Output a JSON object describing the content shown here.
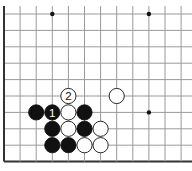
{
  "board": {
    "title": "Go board diagram",
    "origin_x": 4,
    "origin_y": 14,
    "spacing_x": 16.1,
    "spacing_y": 16.4,
    "cols": 12,
    "rows": 10,
    "line_color": "#9a9a9a",
    "edge_color": "#333333",
    "left_edge": true,
    "bottom_edge": true,
    "right_extend_to": 192,
    "top_extend_from": 6
  },
  "star_points": [
    {
      "col": 3,
      "row": 0
    },
    {
      "col": 9,
      "row": 0
    },
    {
      "col": 9,
      "row": 6
    }
  ],
  "stones": [
    {
      "col": 4,
      "row": 5,
      "color": "white",
      "label": "2"
    },
    {
      "col": 7,
      "row": 5,
      "color": "white",
      "label": ""
    },
    {
      "col": 2,
      "row": 6,
      "color": "black",
      "label": ""
    },
    {
      "col": 3,
      "row": 6,
      "color": "black",
      "label": "1"
    },
    {
      "col": 4,
      "row": 6,
      "color": "white",
      "label": ""
    },
    {
      "col": 5,
      "row": 6,
      "color": "black",
      "label": ""
    },
    {
      "col": 3,
      "row": 7,
      "color": "black",
      "label": ""
    },
    {
      "col": 4,
      "row": 7,
      "color": "white",
      "label": ""
    },
    {
      "col": 5,
      "row": 7,
      "color": "black",
      "label": ""
    },
    {
      "col": 6,
      "row": 7,
      "color": "white",
      "label": ""
    },
    {
      "col": 3,
      "row": 8,
      "color": "black",
      "label": ""
    },
    {
      "col": 4,
      "row": 8,
      "color": "black",
      "label": ""
    },
    {
      "col": 5,
      "row": 8,
      "color": "white",
      "label": ""
    },
    {
      "col": 6,
      "row": 8,
      "color": "white",
      "label": ""
    }
  ]
}
